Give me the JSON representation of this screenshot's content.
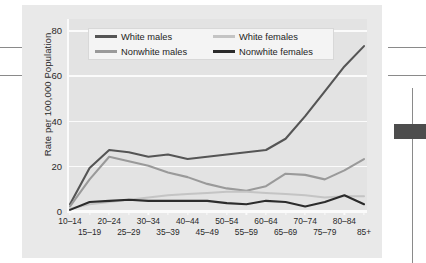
{
  "chart_data": {
    "type": "line",
    "title": "",
    "xlabel": "",
    "ylabel": "Rate per 100,000 Population",
    "ylim": [
      0,
      85
    ],
    "yticks": [
      0,
      20,
      40,
      60,
      80
    ],
    "grid": true,
    "legend_position": "top-left-inside",
    "categories": [
      "10–14",
      "15–19",
      "20–24",
      "25–29",
      "30–34",
      "35–39",
      "40–44",
      "45–49",
      "50–54",
      "55–59",
      "60–64",
      "65–69",
      "70–74",
      "75–79",
      "80–84",
      "85+"
    ],
    "series": [
      {
        "name": "White males",
        "color": "#555555",
        "width": 2.1,
        "values": [
          3,
          19,
          27,
          26,
          24,
          25,
          23,
          24,
          25,
          26,
          27,
          32,
          42,
          53,
          64,
          73
        ]
      },
      {
        "name": "Nonwhite males",
        "color": "#9a9a9a",
        "width": 2.1,
        "values": [
          2,
          14,
          24,
          22,
          20,
          17,
          15,
          12,
          10,
          9,
          11,
          16.5,
          16,
          14,
          18,
          23
        ]
      },
      {
        "name": "White females",
        "color": "#c4c4c4",
        "width": 2.1,
        "values": [
          1,
          3,
          4,
          5,
          6,
          7,
          7.5,
          8,
          8.5,
          8.5,
          8,
          7.5,
          7,
          6,
          6.5,
          6.5
        ]
      },
      {
        "name": "Nonwhite females",
        "color": "#2b2b2b",
        "width": 2.1,
        "values": [
          0.5,
          4,
          4.5,
          5,
          4.5,
          4.5,
          4.5,
          4.5,
          3.5,
          3,
          4.5,
          4,
          2,
          4,
          7,
          3
        ]
      }
    ]
  },
  "legend": {
    "items": [
      {
        "label": "White males",
        "color": "#555555"
      },
      {
        "label": "White females",
        "color": "#c4c4c4"
      },
      {
        "label": "Nonwhite males",
        "color": "#9a9a9a"
      },
      {
        "label": "Nonwhite females",
        "color": "#2b2b2b"
      }
    ]
  },
  "colors": {
    "figure_background": "#e9e9e9",
    "plot_background": "#e3e3e3",
    "gridline": "#fbfbfb",
    "text": "#2a2a2a",
    "artifact_rule": "#8a8a8a",
    "artifact_block": "#4d4d4d"
  }
}
